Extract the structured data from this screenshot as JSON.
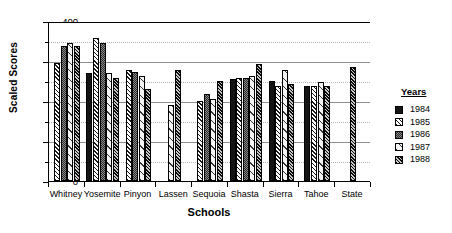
{
  "chart_data": {
    "type": "bar",
    "title": "",
    "xlabel": "Schools",
    "ylabel": "Scaled Scores",
    "ylim": [
      0,
      400
    ],
    "ytick_labels": [
      "0",
      "100",
      "200",
      "300",
      "400"
    ],
    "ytick_values": [
      0,
      100,
      200,
      300,
      400
    ],
    "yminor_values": [
      50,
      150,
      250,
      350
    ],
    "grid": true,
    "legend_position": "right",
    "legend_title": "Years",
    "categories": [
      "Whitney",
      "Yosemite",
      "Pinyon",
      "Lassen",
      "Sequoia",
      "Shasta",
      "Sierra",
      "Tahoe",
      "State"
    ],
    "series": [
      {
        "name": "1984",
        "pattern": "solid-black",
        "values": [
          null,
          270,
          null,
          null,
          null,
          255,
          250,
          238,
          null
        ]
      },
      {
        "name": "1985",
        "pattern": "diagonal-hatch",
        "values": [
          295,
          358,
          278,
          null,
          200,
          258,
          237,
          238,
          null
        ]
      },
      {
        "name": "1986",
        "pattern": "dark-stipple",
        "values": [
          338,
          345,
          272,
          null,
          218,
          258,
          null,
          null,
          null
        ]
      },
      {
        "name": "1987",
        "pattern": "white-line",
        "values": [
          345,
          270,
          262,
          190,
          205,
          262,
          278,
          247,
          null
        ]
      },
      {
        "name": "1988",
        "pattern": "dense-hatch",
        "values": [
          338,
          258,
          230,
          278,
          250,
          292,
          242,
          238,
          285
        ]
      }
    ]
  },
  "legend": {
    "title": "Years",
    "items": [
      {
        "label": "1984",
        "pattern": "solid-black"
      },
      {
        "label": "1985",
        "pattern": "diagonal-hatch"
      },
      {
        "label": "1986",
        "pattern": "dark-stipple"
      },
      {
        "label": "1987",
        "pattern": "white-line"
      },
      {
        "label": "1988",
        "pattern": "dense-hatch"
      }
    ]
  }
}
